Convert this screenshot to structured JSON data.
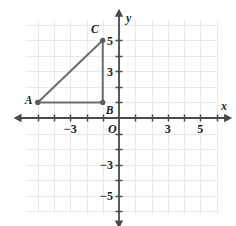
{
  "chart_data": {
    "type": "scatter",
    "title": "",
    "xlabel": "x",
    "ylabel": "y",
    "grid": true,
    "legend": null,
    "xlim": [
      -5.75,
      6.1
    ],
    "ylim": [
      -6.2,
      6.25
    ],
    "origin_label": "O",
    "x_ticks": [
      -5,
      -4,
      -3,
      -2,
      -1,
      1,
      2,
      3,
      4,
      5,
      6
    ],
    "y_ticks": [
      -6,
      -5,
      -4,
      -3,
      -2,
      -1,
      1,
      2,
      3,
      4,
      5
    ],
    "x_tick_labels": [
      {
        "value": -3,
        "text": "−3"
      },
      {
        "value": 3,
        "text": "3"
      },
      {
        "value": 5,
        "text": "5"
      }
    ],
    "y_tick_labels": [
      {
        "value": 5,
        "text": "5"
      },
      {
        "value": 3,
        "text": "3"
      },
      {
        "value": -3,
        "text": "−3"
      },
      {
        "value": -5,
        "text": "−5"
      }
    ],
    "points": [
      {
        "label": "A",
        "x": -5,
        "y": 1
      },
      {
        "label": "B",
        "x": -1,
        "y": 1
      },
      {
        "label": "C",
        "x": -1,
        "y": 5
      }
    ],
    "shape": {
      "name": "triangle-ABC",
      "vertices": [
        "A",
        "B",
        "C"
      ],
      "closed": true
    },
    "colors": {
      "grid": "#e9e9e9",
      "axis": "#4a4a4a",
      "shape_stroke": "#6d6d6d",
      "point_fill": "#5a5a5a",
      "text": "#1c1c1c",
      "background": "#ffffff"
    }
  }
}
